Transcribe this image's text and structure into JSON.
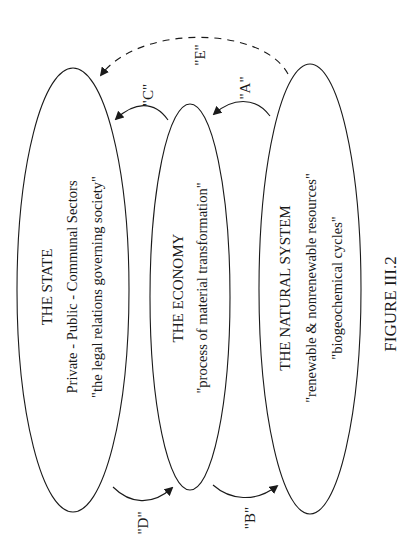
{
  "figure": {
    "caption": "FIGURE III.2",
    "orientation": "rotated 90° counter-clockwise (text reads bottom-to-top)"
  },
  "nodes": [
    {
      "id": "state",
      "title": "THE STATE",
      "lines": [
        "Private - Public - Communal Sectors",
        "\"the legal relations governing society\""
      ]
    },
    {
      "id": "economy",
      "title": "THE ECONOMY",
      "lines": [
        "\"process of material transformation\""
      ]
    },
    {
      "id": "natural",
      "title": "THE NATURAL SYSTEM",
      "lines": [
        "\"renewable & nonrenewable resources\"",
        "\"biogeochemical cycles\""
      ]
    }
  ],
  "edges": [
    {
      "id": "A",
      "label": "\"A\"",
      "from": "natural",
      "to": "economy",
      "style": "solid"
    },
    {
      "id": "B",
      "label": "\"B\"",
      "from": "economy",
      "to": "natural",
      "style": "solid"
    },
    {
      "id": "C",
      "label": "\"C\"",
      "from": "economy",
      "to": "state",
      "style": "solid"
    },
    {
      "id": "D",
      "label": "\"D\"",
      "from": "state",
      "to": "economy",
      "style": "solid"
    },
    {
      "id": "E",
      "label": "\"E\"",
      "from": "natural",
      "to": "state",
      "style": "dashed"
    }
  ],
  "colors": {
    "background": "#ffffff",
    "ink": "#1a1a1a"
  }
}
